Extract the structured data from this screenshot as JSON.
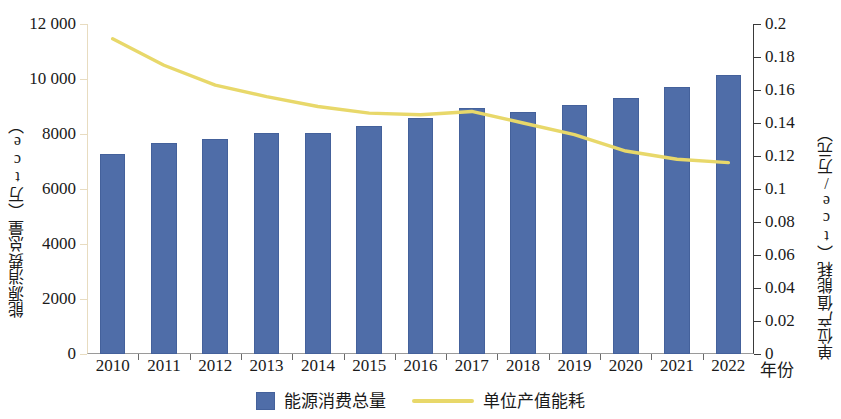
{
  "chart_data": {
    "type": "bar",
    "title": "",
    "subtitle": "",
    "xlabel": "年份",
    "categories": [
      "2010",
      "2011",
      "2012",
      "2013",
      "2014",
      "2015",
      "2016",
      "2017",
      "2018",
      "2019",
      "2020",
      "2021",
      "2022"
    ],
    "grid": false,
    "legend_position": "bottom",
    "axes": {
      "left": {
        "label": "能源消费总量（万tce）",
        "ylim": [
          0,
          12000
        ],
        "ticks": [
          0,
          2000,
          4000,
          6000,
          8000,
          10000,
          12000
        ],
        "tick_labels": [
          "0",
          "2000",
          "4000",
          "6000",
          "8000",
          "10 000",
          "12 000"
        ],
        "color": "#e8dcc0"
      },
      "right": {
        "label": "单位产值能耗（tce/万元）",
        "ylim": [
          0,
          0.2
        ],
        "ticks": [
          0,
          0.02,
          0.04,
          0.06,
          0.08,
          0.1,
          0.12,
          0.14,
          0.16,
          0.18,
          0.2
        ],
        "tick_labels": [
          "0",
          "0.02",
          "0.04",
          "0.06",
          "0.08",
          "0.1",
          "0.12",
          "0.14",
          "0.16",
          "0.18",
          "0.2"
        ],
        "color": "#3a3a3a"
      }
    },
    "series": [
      {
        "name": "能源消费总量",
        "type": "bar",
        "axis": "left",
        "unit": "万tce",
        "color": "#4f6da8",
        "values": [
          7270,
          7680,
          7810,
          8050,
          8030,
          8280,
          8570,
          8950,
          8800,
          9040,
          9300,
          9700,
          10130
        ]
      },
      {
        "name": "单位产值能耗",
        "type": "line",
        "axis": "right",
        "unit": "tce/万元",
        "color": "#e8d86a",
        "values": [
          0.191,
          0.175,
          0.163,
          0.156,
          0.15,
          0.146,
          0.145,
          0.147,
          0.14,
          0.133,
          0.123,
          0.118,
          0.116
        ]
      }
    ]
  },
  "legend": {
    "items": [
      {
        "label": "能源消费总量",
        "marker": "bar-swatch"
      },
      {
        "label": "单位产值能耗",
        "marker": "line-swatch"
      }
    ]
  }
}
